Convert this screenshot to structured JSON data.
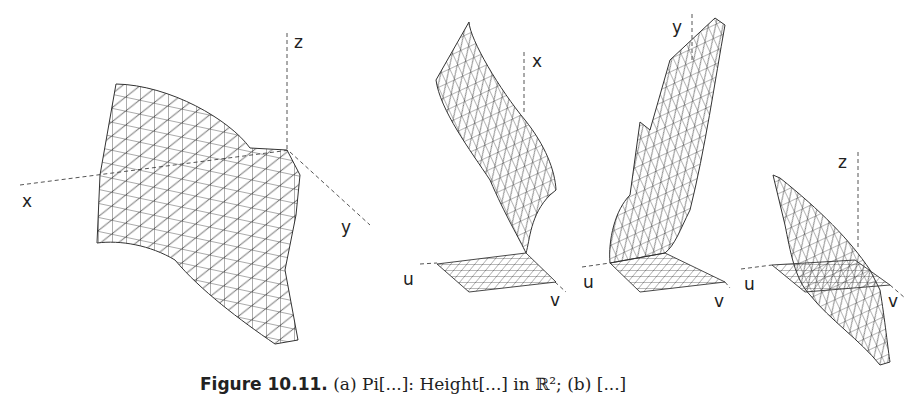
{
  "figure": {
    "panels": [
      {
        "id": "a",
        "description": "Triangulated wireframe surface in xyz space",
        "axes": {
          "x": "x",
          "y": "y",
          "z": "z"
        }
      },
      {
        "id": "b1",
        "description": "Coordinate function x over uv parameter grid",
        "axes": {
          "u": "u",
          "v": "v",
          "h": "x"
        }
      },
      {
        "id": "b2",
        "description": "Coordinate function y over uv parameter grid",
        "axes": {
          "u": "u",
          "v": "v",
          "h": "y"
        }
      },
      {
        "id": "b3",
        "description": "Coordinate function z over uv parameter grid",
        "axes": {
          "u": "u",
          "v": "v",
          "h": "z"
        }
      }
    ],
    "caption": {
      "label": "Figure 10.11.",
      "text": "(a) Pi[...]: Height[...] in ℝ²; (b) [...]"
    },
    "colors": {
      "mesh": "#333333",
      "axis": "#555555",
      "background": "#ffffff"
    }
  }
}
